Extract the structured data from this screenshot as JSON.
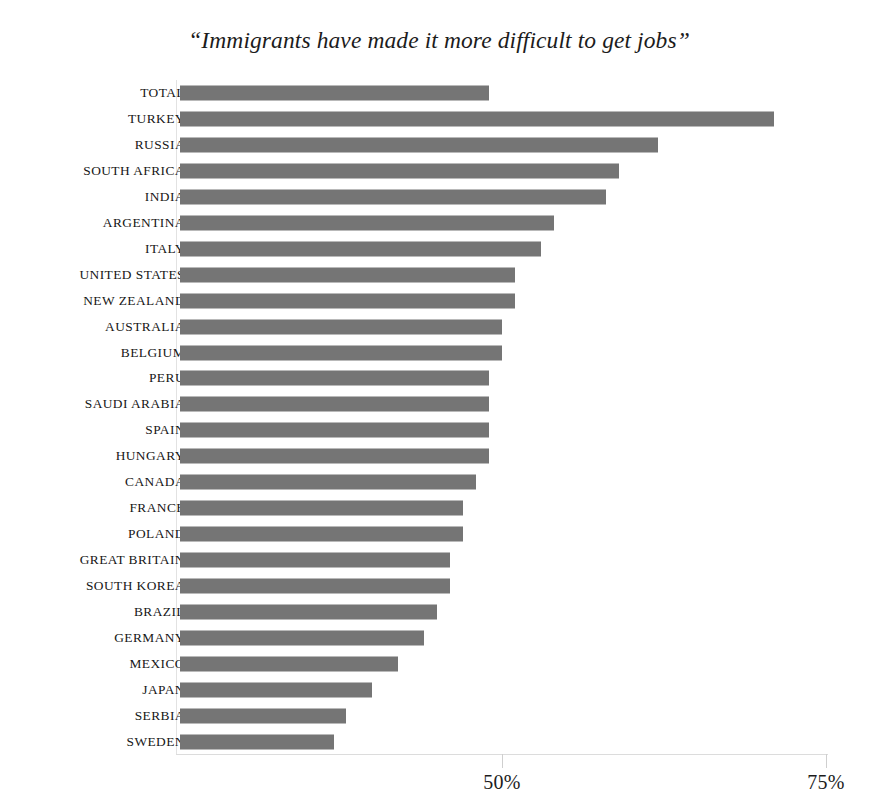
{
  "chart_data": {
    "type": "bar",
    "orientation": "horizontal",
    "title": "“Immigrants have made it more difficult to get jobs”",
    "xlabel": "",
    "ylabel": "",
    "xlim": [
      25.1,
      75.3
    ],
    "grid": false,
    "legend": null,
    "bar_color": "#757575",
    "axis_ticks": [
      {
        "label": "50%",
        "value": 50
      },
      {
        "label": "75%",
        "value": 75
      }
    ],
    "categories": [
      "TOTAL",
      "TURKEY",
      "RUSSIA",
      "SOUTH AFRICA",
      "INDIA",
      "ARGENTINA",
      "ITALY",
      "UNITED STATES",
      "NEW ZEALAND",
      "AUSTRALIA",
      "BELGIUM",
      "PERU",
      "SAUDI ARABIA",
      "SPAIN",
      "HUNGARY",
      "CANADA",
      "FRANCE",
      "POLAND",
      "GREAT BRITAIN",
      "SOUTH KOREA",
      "BRAZIL",
      "GERMANY",
      "MEXICO",
      "JAPAN",
      "SERBIA",
      "SWEDEN"
    ],
    "values": [
      49,
      71,
      62,
      59,
      58,
      54,
      53,
      51,
      51,
      50,
      50,
      49,
      49,
      49,
      49,
      48,
      47,
      47,
      46,
      46,
      45,
      44,
      42,
      40,
      38,
      37
    ]
  }
}
